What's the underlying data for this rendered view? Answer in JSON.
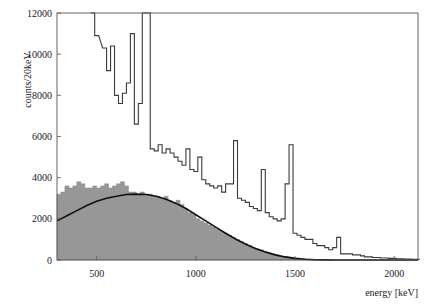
{
  "chart_data": {
    "type": "histogram",
    "title": "",
    "xlabel": "energy [keV]",
    "ylabel": "counts/20keV",
    "xlim": [
      300,
      2120
    ],
    "ylim": [
      0,
      12000
    ],
    "xticks": [
      500,
      1000,
      1500,
      2000
    ],
    "yticks": [
      0,
      2000,
      4000,
      6000,
      8000,
      10000,
      12000
    ],
    "grid": false,
    "legend": null,
    "series": [
      {
        "name": "measured spectrum (outline)",
        "style": "step-outline",
        "color": "#333333",
        "bins": [
          [
            470,
            12000
          ],
          [
            490,
            10900
          ],
          [
            530,
            10300
          ],
          [
            550,
            9200
          ],
          [
            570,
            10400
          ],
          [
            590,
            8000
          ],
          [
            610,
            7600
          ],
          [
            630,
            8100
          ],
          [
            650,
            8600
          ],
          [
            670,
            11000
          ],
          [
            690,
            6600
          ],
          [
            710,
            7600
          ],
          [
            730,
            12000
          ],
          [
            750,
            12000
          ],
          [
            770,
            5400
          ],
          [
            790,
            5300
          ],
          [
            810,
            5600
          ],
          [
            830,
            5200
          ],
          [
            850,
            5400
          ],
          [
            870,
            5200
          ],
          [
            890,
            5000
          ],
          [
            910,
            4800
          ],
          [
            930,
            4600
          ],
          [
            950,
            5400
          ],
          [
            970,
            4400
          ],
          [
            990,
            4300
          ],
          [
            1010,
            5000
          ],
          [
            1030,
            3900
          ],
          [
            1050,
            3700
          ],
          [
            1070,
            3600
          ],
          [
            1090,
            3500
          ],
          [
            1110,
            3600
          ],
          [
            1130,
            3300
          ],
          [
            1150,
            3700
          ],
          [
            1170,
            3700
          ],
          [
            1190,
            5800
          ],
          [
            1210,
            3000
          ],
          [
            1230,
            2900
          ],
          [
            1250,
            2800
          ],
          [
            1270,
            2600
          ],
          [
            1290,
            2500
          ],
          [
            1310,
            2400
          ],
          [
            1330,
            4400
          ],
          [
            1350,
            2300
          ],
          [
            1370,
            2100
          ],
          [
            1390,
            2000
          ],
          [
            1410,
            1900
          ],
          [
            1430,
            2000
          ],
          [
            1450,
            3700
          ],
          [
            1470,
            5600
          ],
          [
            1490,
            1300
          ],
          [
            1510,
            1200
          ],
          [
            1530,
            1100
          ],
          [
            1550,
            1000
          ],
          [
            1570,
            1000
          ],
          [
            1590,
            800
          ],
          [
            1610,
            700
          ],
          [
            1630,
            700
          ],
          [
            1650,
            600
          ],
          [
            1670,
            500
          ],
          [
            1690,
            600
          ],
          [
            1710,
            1100
          ],
          [
            1730,
            300
          ],
          [
            1750,
            300
          ],
          [
            1770,
            300
          ],
          [
            1790,
            250
          ],
          [
            1810,
            250
          ],
          [
            1830,
            200
          ],
          [
            1850,
            150
          ],
          [
            1870,
            150
          ],
          [
            1890,
            120
          ],
          [
            1910,
            120
          ],
          [
            1930,
            100
          ],
          [
            1950,
            100
          ],
          [
            1970,
            80
          ],
          [
            1990,
            80
          ],
          [
            2010,
            60
          ],
          [
            2030,
            60
          ],
          [
            2050,
            50
          ],
          [
            2070,
            50
          ],
          [
            2090,
            40
          ],
          [
            2110,
            40
          ]
        ]
      },
      {
        "name": "background / gated spectrum (filled)",
        "style": "step-filled",
        "color": "#8c8c8c",
        "bins": [
          [
            300,
            3200
          ],
          [
            320,
            3300
          ],
          [
            340,
            3600
          ],
          [
            360,
            3500
          ],
          [
            380,
            3600
          ],
          [
            400,
            3800
          ],
          [
            420,
            3700
          ],
          [
            440,
            3500
          ],
          [
            460,
            3500
          ],
          [
            480,
            3600
          ],
          [
            500,
            3500
          ],
          [
            520,
            3600
          ],
          [
            540,
            3700
          ],
          [
            560,
            3500
          ],
          [
            580,
            3600
          ],
          [
            600,
            3700
          ],
          [
            620,
            3800
          ],
          [
            640,
            3600
          ],
          [
            660,
            3300
          ],
          [
            680,
            3300
          ],
          [
            700,
            3200
          ],
          [
            720,
            3300
          ],
          [
            740,
            3200
          ],
          [
            760,
            3200
          ],
          [
            780,
            3100
          ],
          [
            800,
            3100
          ],
          [
            820,
            3000
          ],
          [
            840,
            3100
          ],
          [
            860,
            2900
          ],
          [
            880,
            2800
          ],
          [
            900,
            2900
          ],
          [
            920,
            2700
          ],
          [
            940,
            2500
          ],
          [
            960,
            2300
          ],
          [
            980,
            2200
          ],
          [
            1000,
            2000
          ],
          [
            1020,
            1900
          ],
          [
            1040,
            1800
          ],
          [
            1060,
            1700
          ],
          [
            1080,
            1600
          ],
          [
            1100,
            1500
          ],
          [
            1120,
            1400
          ],
          [
            1140,
            1300
          ],
          [
            1160,
            1200
          ],
          [
            1180,
            1100
          ],
          [
            1200,
            1000
          ],
          [
            1220,
            900
          ],
          [
            1240,
            800
          ],
          [
            1260,
            700
          ],
          [
            1280,
            600
          ],
          [
            1300,
            550
          ],
          [
            1320,
            500
          ],
          [
            1340,
            420
          ],
          [
            1360,
            360
          ],
          [
            1380,
            300
          ],
          [
            1400,
            250
          ],
          [
            1420,
            200
          ],
          [
            1440,
            170
          ],
          [
            1460,
            140
          ],
          [
            1480,
            110
          ],
          [
            1500,
            90
          ],
          [
            1520,
            70
          ],
          [
            1540,
            55
          ],
          [
            1560,
            40
          ],
          [
            1580,
            30
          ],
          [
            1600,
            20
          ],
          [
            1620,
            15
          ],
          [
            1640,
            10
          ],
          [
            1660,
            5
          ],
          [
            1680,
            0
          ]
        ]
      },
      {
        "name": "fit curve",
        "style": "line",
        "color": "#111111",
        "x": [
          300,
          350,
          400,
          450,
          500,
          550,
          600,
          650,
          700,
          750,
          800,
          850,
          900,
          950,
          1000,
          1050,
          1100,
          1150,
          1200,
          1250,
          1300,
          1350,
          1400,
          1450,
          1500,
          1550,
          1600,
          1650,
          1700
        ],
        "y": [
          1900,
          2150,
          2400,
          2650,
          2850,
          3000,
          3100,
          3180,
          3200,
          3180,
          3100,
          2950,
          2750,
          2500,
          2200,
          1900,
          1600,
          1300,
          1020,
          780,
          560,
          390,
          250,
          150,
          80,
          40,
          15,
          5,
          0
        ]
      }
    ]
  },
  "axes": {
    "xlabel": "energy [keV]",
    "ylabel": "counts/20keV",
    "xtick_labels": [
      "500",
      "1000",
      "1500",
      "2000"
    ],
    "ytick_labels": [
      "0",
      "2000",
      "4000",
      "6000",
      "8000",
      "10000",
      "12000"
    ]
  }
}
